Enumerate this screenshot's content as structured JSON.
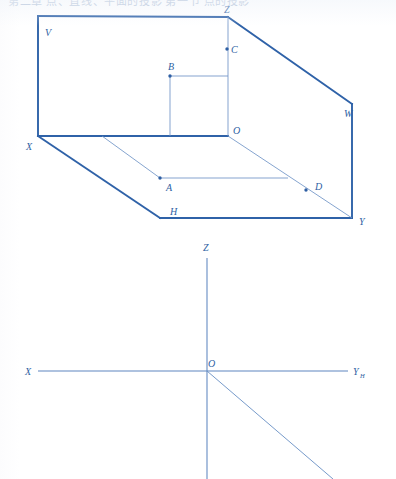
{
  "page": {
    "width": 396,
    "height": 479,
    "background": "#ffffff",
    "stroke_color": "#2f62a8",
    "thin_stroke_color": "#6f93c6",
    "label_color": "#2e5fa3",
    "header_text": "第二章 点、直线、平面的投影 第一节 点的投影"
  },
  "figure_top": {
    "name": "three-projection-plane-box",
    "description": "Three mutually perpendicular projection planes V, H, W forming an open box with axes OX, OY, OZ and points A, B, C, D",
    "planes": [
      {
        "id": "V",
        "label": "V",
        "label_x": 45,
        "label_y": 36
      },
      {
        "id": "H",
        "label": "H",
        "label_x": 170,
        "label_y": 215
      },
      {
        "id": "W",
        "label": "W",
        "label_x": 344,
        "label_y": 117
      }
    ],
    "vertices": [
      {
        "id": "X",
        "label": "X",
        "x": 38,
        "y": 136,
        "label_x": 26,
        "label_y": 150
      },
      {
        "id": "Z",
        "label": "Z",
        "x": 228,
        "y": 17,
        "label_x": 228,
        "label_y": 13
      },
      {
        "id": "O",
        "label": "O",
        "x": 228,
        "y": 136,
        "label_x": 237,
        "label_y": 134
      },
      {
        "id": "Y",
        "label": "Y",
        "x": 352,
        "y": 218,
        "label_x": 361,
        "label_y": 225
      },
      {
        "id": "W",
        "label": "W",
        "x": 352,
        "y": 104,
        "label_x": 344,
        "label_y": 117
      }
    ],
    "points": [
      {
        "id": "A",
        "label": "A",
        "x": 160,
        "y": 178,
        "label_x": 168,
        "label_y": 190
      },
      {
        "id": "B",
        "label": "B",
        "x": 170,
        "y": 76,
        "label_x": 172,
        "label_y": 70
      },
      {
        "id": "C",
        "label": "C",
        "x": 227,
        "y": 49,
        "label_x": 232,
        "label_y": 53
      },
      {
        "id": "D",
        "label": "D",
        "x": 306,
        "y": 190,
        "label_x": 316,
        "label_y": 189
      }
    ],
    "thick_outline": "M 38 16 L 228 17 L 352 104 L 352 218 L 160 218 L 38 136 Z",
    "edges_thick": [
      {
        "id": "edge-V-top",
        "from": [
          38,
          16
        ],
        "to": [
          228,
          17
        ]
      },
      {
        "id": "edge-Z-W",
        "from": [
          228,
          17
        ],
        "to": [
          352,
          104
        ]
      },
      {
        "id": "edge-W-Y",
        "from": [
          352,
          104
        ],
        "to": [
          352,
          218
        ]
      },
      {
        "id": "edge-Y-H",
        "from": [
          352,
          218
        ],
        "to": [
          160,
          218
        ]
      },
      {
        "id": "edge-H-X",
        "from": [
          160,
          218
        ],
        "to": [
          38,
          136
        ]
      },
      {
        "id": "edge-X-V",
        "from": [
          38,
          136
        ],
        "to": [
          38,
          16
        ]
      },
      {
        "id": "axis-OX",
        "from": [
          38,
          136
        ],
        "to": [
          228,
          136
        ]
      }
    ],
    "edges_thin": [
      {
        "id": "axis-OZ",
        "from": [
          228,
          136
        ],
        "to": [
          228,
          17
        ]
      },
      {
        "id": "axis-OY",
        "from": [
          228,
          136
        ],
        "to": [
          352,
          218
        ]
      },
      {
        "id": "line-B-horizontal",
        "from": [
          170,
          76
        ],
        "to": [
          228,
          76
        ]
      },
      {
        "id": "line-B-vertical",
        "from": [
          170,
          76
        ],
        "to": [
          170,
          136
        ]
      },
      {
        "id": "line-A-to-OX",
        "from": [
          160,
          178
        ],
        "to": [
          102,
          136
        ]
      },
      {
        "id": "line-A-horizontal",
        "from": [
          160,
          178
        ],
        "to": [
          288,
          178
        ]
      }
    ]
  },
  "figure_bottom": {
    "name": "projection-axes-unfolded",
    "description": "Unfolded projection axes: X to the left, Z upward, Y-H to the right, and Y-W diagonal downward from origin O",
    "origin": {
      "id": "O",
      "label": "O",
      "x": 207,
      "y": 371,
      "label_x": 212,
      "label_y": 367
    },
    "axes": [
      {
        "id": "axis-X",
        "label": "X",
        "from": [
          38,
          371
        ],
        "to": [
          207,
          371
        ],
        "label_x": 28,
        "label_y": 375
      },
      {
        "id": "axis-Z",
        "label": "Z",
        "from": [
          207,
          371
        ],
        "to": [
          207,
          258
        ],
        "label_x": 207,
        "label_y": 251
      },
      {
        "id": "axis-YH",
        "label": "Y",
        "sublabel": "H",
        "from": [
          207,
          371
        ],
        "to": [
          348,
          371
        ],
        "label_x": 354,
        "label_y": 375,
        "sublabel_x": 362,
        "sublabel_y": 378
      },
      {
        "id": "axis-Z-down",
        "label": "",
        "from": [
          207,
          371
        ],
        "to": [
          207,
          479
        ]
      },
      {
        "id": "axis-YW-diagonal",
        "label": "",
        "from": [
          207,
          371
        ],
        "to": [
          333,
          479
        ]
      }
    ]
  }
}
